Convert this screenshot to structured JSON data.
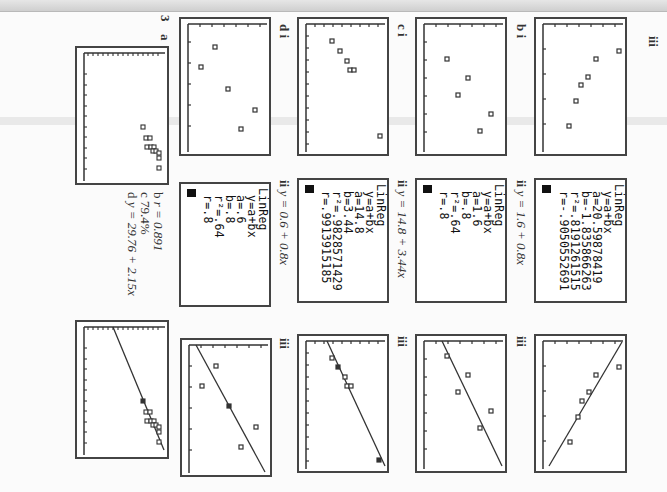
{
  "page": {
    "orientation": "rotated 90 degrees clockwise",
    "question_number": "3"
  },
  "columns": [
    {
      "id": "first",
      "label_i": "",
      "label_ii": "",
      "label_iii": "iii",
      "calc": {
        "lines": [
          "LinReg",
          " y=a+bx",
          " a=20.59878419",
          " b=-1.835866263",
          " r²=.8191261515",
          " r=-.9050552691"
        ]
      }
    },
    {
      "id": "b",
      "label_i": "b i",
      "label_ii": "ii",
      "equation": "y = 1.6 + 0.8x",
      "label_iii": "iii",
      "calc": {
        "lines": [
          "LinReg",
          " y=a+bx",
          " a=1.6",
          " b=.8",
          " r²=.64",
          " r=.8"
        ]
      }
    },
    {
      "id": "c",
      "label_i": "c i",
      "label_ii": "ii",
      "equation": "y = 14.8 + 3.44x",
      "label_iii": "iii",
      "calc": {
        "lines": [
          "LinReg",
          " y=a+bx",
          " a=14.8",
          " b=3.44",
          " r²=.9828571429",
          " r=.9913915185"
        ]
      }
    },
    {
      "id": "d",
      "label_i": "d i",
      "label_ii": "ii",
      "equation": "y = 0.6 + 0.8x",
      "label_iii": "iii",
      "calc": {
        "lines": [
          "LinReg",
          " y=a+bx",
          " a=.6",
          " b=.8",
          " r²=.64",
          " r=.8"
        ]
      }
    },
    {
      "id": "q3",
      "number": "3",
      "label_a": "a",
      "answers": [
        {
          "letter": "b",
          "text": "r = 0.891"
        },
        {
          "letter": "c",
          "text": "79.4%"
        },
        {
          "letter": "d",
          "text": "y = 29.76 + 2.15x"
        }
      ],
      "label_e": "e"
    }
  ]
}
